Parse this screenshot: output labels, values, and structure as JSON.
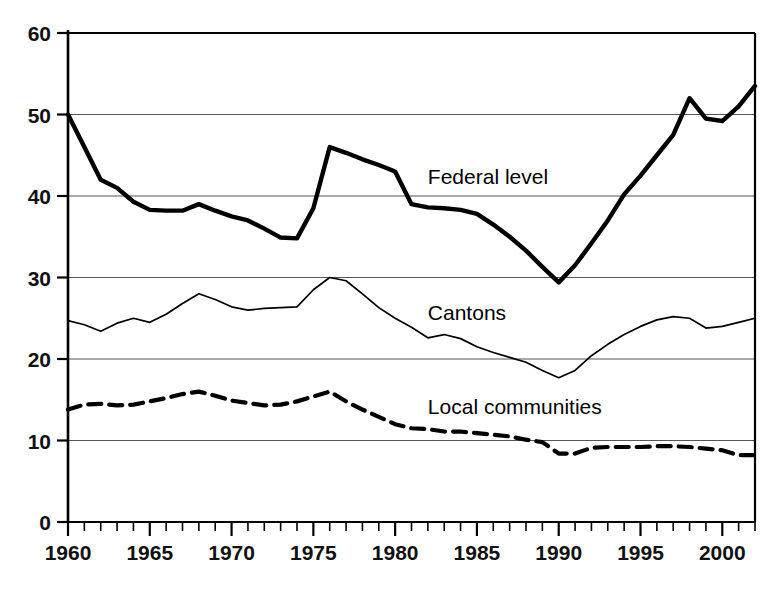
{
  "chart_data": {
    "type": "line",
    "title": "",
    "subtitle": "",
    "xlabel": "",
    "ylabel": "",
    "xlim": [
      1960,
      2002
    ],
    "ylim": [
      0,
      60
    ],
    "grid": "horizontal",
    "legend_position": "inline-annotations",
    "y_ticks": [
      "0",
      "10",
      "20",
      "30",
      "40",
      "50",
      "60"
    ],
    "y_tick_values": [
      0,
      10,
      20,
      30,
      40,
      50,
      60
    ],
    "x_ticks": [
      "1960",
      "1965",
      "1970",
      "1975",
      "1980",
      "1985",
      "1990",
      "1995",
      "2000"
    ],
    "x_tick_values": [
      1960,
      1965,
      1970,
      1975,
      1980,
      1985,
      1990,
      1995,
      2000
    ],
    "x_minor_tick_interval": 1,
    "x": [
      1960,
      1961,
      1962,
      1963,
      1964,
      1965,
      1966,
      1967,
      1968,
      1969,
      1970,
      1971,
      1972,
      1973,
      1974,
      1975,
      1976,
      1977,
      1978,
      1979,
      1980,
      1981,
      1982,
      1983,
      1984,
      1985,
      1986,
      1987,
      1988,
      1989,
      1990,
      1991,
      1992,
      1993,
      1994,
      1995,
      1996,
      1997,
      1998,
      1999,
      2000,
      2001,
      2002
    ],
    "series": [
      {
        "name": "Federal level",
        "style": "solid-thick",
        "color": "#000000",
        "label_x": 1982.0,
        "label_y": 41.5,
        "values": [
          50.0,
          46.0,
          42.0,
          41.0,
          39.3,
          38.3,
          38.2,
          38.2,
          39.0,
          38.2,
          37.5,
          37.0,
          36.0,
          34.9,
          34.8,
          38.5,
          46.0,
          45.3,
          44.5,
          43.8,
          43.0,
          39.0,
          38.6,
          38.5,
          38.3,
          37.8,
          36.5,
          35.0,
          33.3,
          31.3,
          29.4,
          31.5,
          34.2,
          37.0,
          40.2,
          42.5,
          45.0,
          47.5,
          52.0,
          49.5,
          49.2,
          51.0,
          53.5
        ]
      },
      {
        "name": "Cantons",
        "style": "solid-thin",
        "color": "#000000",
        "label_x": 1982.0,
        "label_y": 24.8,
        "values": [
          24.7,
          24.2,
          23.4,
          24.4,
          25.0,
          24.5,
          25.5,
          26.8,
          28.0,
          27.3,
          26.4,
          26.0,
          26.2,
          26.3,
          26.4,
          28.5,
          30.0,
          29.6,
          28.0,
          26.3,
          25.0,
          23.9,
          22.6,
          23.0,
          22.5,
          21.5,
          20.8,
          20.2,
          19.6,
          18.6,
          17.7,
          18.6,
          20.4,
          21.8,
          23.0,
          24.0,
          24.8,
          25.2,
          25.0,
          23.8,
          24.0,
          24.5,
          25.0
        ]
      },
      {
        "name": "Local communities",
        "style": "dashed",
        "color": "#000000",
        "label_x": 1982.0,
        "label_y": 13.2,
        "values": [
          13.8,
          14.4,
          14.5,
          14.3,
          14.4,
          14.8,
          15.2,
          15.7,
          16.0,
          15.5,
          14.9,
          14.6,
          14.3,
          14.4,
          14.8,
          15.4,
          16.0,
          14.8,
          13.8,
          12.9,
          12.0,
          11.5,
          11.4,
          11.1,
          11.1,
          10.9,
          10.7,
          10.5,
          10.1,
          9.8,
          8.4,
          8.4,
          9.1,
          9.2,
          9.2,
          9.2,
          9.3,
          9.3,
          9.2,
          9.0,
          8.8,
          8.2,
          8.2
        ]
      }
    ]
  },
  "axis": {
    "y_labels": [
      "60",
      "50",
      "40",
      "30",
      "20",
      "10",
      "0"
    ],
    "x_labels": [
      "1960",
      "1965",
      "1970",
      "1975",
      "1980",
      "1985",
      "1990",
      "1995",
      "2000"
    ]
  },
  "labels": {
    "federal": "Federal level",
    "cantons": "Cantons",
    "local": "Local communities"
  },
  "colors": {
    "line": "#000000",
    "grid": "#555555",
    "axis": "#000000",
    "text": "#111111",
    "background": "#ffffff"
  }
}
